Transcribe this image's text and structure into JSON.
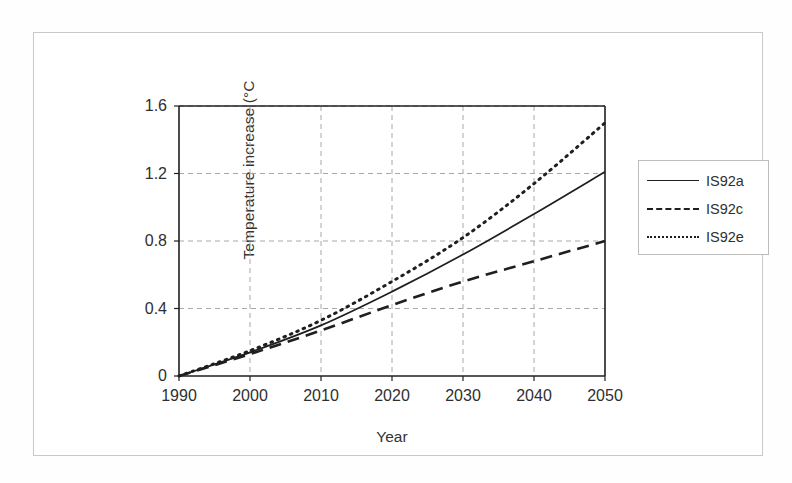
{
  "chart_data": {
    "type": "line",
    "title": "",
    "xlabel": "Year",
    "ylabel": "Temperature increase (°C",
    "xlim": [
      1990,
      2050
    ],
    "ylim": [
      0,
      1.6
    ],
    "xticks": [
      "1990",
      "2000",
      "2010",
      "2020",
      "2030",
      "2040",
      "2050"
    ],
    "yticks": [
      "0",
      "0.4",
      "0.8",
      "1.2",
      "1.6"
    ],
    "grid": true,
    "legend_position": "right-outside",
    "x": [
      1990,
      2000,
      2010,
      2020,
      2030,
      2040,
      2050
    ],
    "series": [
      {
        "name": "IS92a",
        "style": "solid",
        "color": "#1f1f1f",
        "values": [
          0,
          0.14,
          0.3,
          0.5,
          0.72,
          0.96,
          1.21
        ]
      },
      {
        "name": "IS92c",
        "style": "dashed",
        "color": "#1f1f1f",
        "values": [
          0,
          0.13,
          0.27,
          0.42,
          0.56,
          0.68,
          0.8
        ]
      },
      {
        "name": "IS92e",
        "style": "dotted",
        "color": "#1f1f1f",
        "values": [
          0,
          0.15,
          0.33,
          0.56,
          0.82,
          1.14,
          1.5
        ]
      }
    ]
  },
  "legend": {
    "items": [
      {
        "label": "IS92a"
      },
      {
        "label": "IS92c"
      },
      {
        "label": "IS92e"
      }
    ]
  },
  "axes": {
    "y_title": "Temperature increase (°C",
    "x_title": "Year",
    "y_labels": [
      "1.6",
      "1.2",
      "0.8",
      "0.4",
      "0"
    ],
    "x_labels": [
      "1990",
      "2000",
      "2010",
      "2020",
      "2030",
      "2040",
      "2050"
    ]
  },
  "colors": {
    "line": "#1f1f1f",
    "grid": "#a8a8a8",
    "axis": "#1f1f1f",
    "frame": "#c8c8c8",
    "background": "#ffffff"
  }
}
